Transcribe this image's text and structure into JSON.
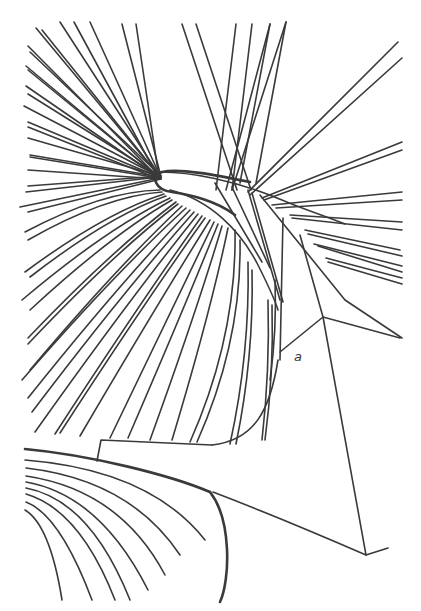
{
  "figure": {
    "title": "",
    "labels": [
      {
        "id": "label-a",
        "text": "a"
      }
    ],
    "stroke_color": "#3a3a3a",
    "background_color": "#ffffff"
  }
}
